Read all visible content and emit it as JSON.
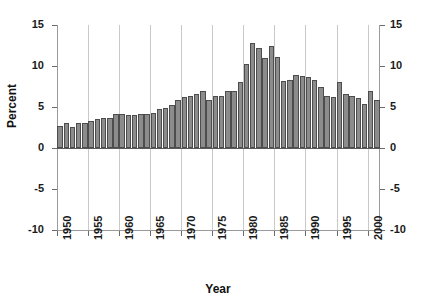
{
  "chart_data": {
    "type": "bar",
    "title": "",
    "xlabel": "Year",
    "ylabel": "Percent",
    "ylim": [
      -10,
      15
    ],
    "yticks": [
      15,
      10,
      5,
      0,
      -5,
      -10
    ],
    "ytick_labels": [
      "15",
      "10",
      "5",
      "0",
      "-5",
      "-10"
    ],
    "right_axis": true,
    "right_ytick_labels": [
      "15",
      "10",
      "5",
      "0",
      "-5",
      "-10"
    ],
    "xlim": [
      1950,
      2002
    ],
    "xticks": [
      1950,
      1955,
      1960,
      1965,
      1970,
      1975,
      1980,
      1985,
      1990,
      1995,
      2000
    ],
    "xtick_labels": [
      "1950",
      "1955",
      "1960",
      "1965",
      "1970",
      "1975",
      "1980",
      "1985",
      "1990",
      "1995",
      "2000"
    ],
    "grid": "vertical-at-xticks",
    "legend": null,
    "bar_color": "#8c8c8c",
    "bar_edge_color": "#4d4d4d",
    "gridline_color": "#c9c9c9",
    "axis_color": "#9a9a9a",
    "categories": [
      "1950",
      "1951",
      "1952",
      "1953",
      "1954",
      "1955",
      "1956",
      "1957",
      "1958",
      "1959",
      "1960",
      "1961",
      "1962",
      "1963",
      "1964",
      "1965",
      "1966",
      "1967",
      "1968",
      "1969",
      "1970",
      "1971",
      "1972",
      "1973",
      "1974",
      "1975",
      "1976",
      "1977",
      "1978",
      "1979",
      "1980",
      "1981",
      "1982",
      "1983",
      "1984",
      "1985",
      "1986",
      "1987",
      "1988",
      "1989",
      "1990",
      "1991",
      "1992",
      "1993",
      "1994",
      "1995",
      "1996",
      "1997",
      "1998",
      "1999",
      "2000",
      "2001"
    ],
    "values": [
      2.7,
      3.0,
      2.6,
      3.0,
      3.1,
      3.3,
      3.5,
      3.6,
      3.6,
      4.2,
      4.1,
      4.0,
      4.0,
      4.1,
      4.2,
      4.3,
      4.8,
      4.9,
      5.3,
      5.8,
      6.2,
      6.3,
      6.6,
      7.0,
      5.9,
      6.4,
      6.4,
      6.9,
      7.0,
      8.1,
      10.3,
      12.8,
      12.2,
      11.0,
      12.4,
      11.1,
      8.2,
      8.3,
      8.9,
      8.8,
      8.6,
      8.3,
      7.5,
      6.4,
      6.2,
      8.0,
      6.6,
      6.3,
      6.1,
      5.4,
      6.9,
      5.8
    ]
  }
}
